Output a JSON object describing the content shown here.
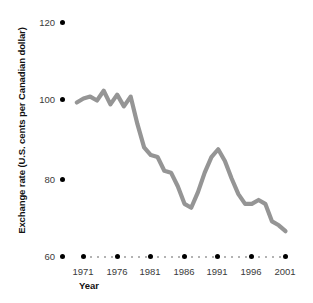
{
  "chart_data": {
    "type": "line",
    "title": "",
    "xlabel": "Year",
    "ylabel": "Exchange rate (U.S. cents per Canadian dollar)",
    "xlim": [
      1970,
      2002
    ],
    "ylim": [
      60,
      120
    ],
    "xticks": [
      1971,
      1976,
      1981,
      1986,
      1991,
      1996,
      2001
    ],
    "xtick_labels": [
      "1971",
      "1976",
      "1981",
      "1986",
      "1991",
      "1996",
      "2001"
    ],
    "yticks": [
      60,
      80,
      100,
      120
    ],
    "ytick_labels": [
      "60",
      "80",
      "100",
      "120"
    ],
    "grid": false,
    "legend": "none",
    "series": [
      {
        "name": "Exchange rate",
        "color": "#959595",
        "x": [
          1970,
          1971,
          1972,
          1973,
          1974,
          1975,
          1976,
          1977,
          1978,
          1979,
          1980,
          1981,
          1982,
          1983,
          1984,
          1985,
          1986,
          1987,
          1988,
          1989,
          1990,
          1991,
          1992,
          1993,
          1994,
          1995,
          1996,
          1997,
          1998,
          1999,
          2000,
          2001
        ],
        "values": [
          99.5,
          100.5,
          101.0,
          100.0,
          102.5,
          99.0,
          101.5,
          98.5,
          101.0,
          94.0,
          88.0,
          86.0,
          85.5,
          82.0,
          81.5,
          78.0,
          73.5,
          72.5,
          76.5,
          81.5,
          85.5,
          87.5,
          84.5,
          80.0,
          76.0,
          73.5,
          73.5,
          74.5,
          73.5,
          69.0,
          68.0,
          66.5
        ]
      }
    ]
  },
  "axes": {
    "y_tick_values": [
      "120",
      "100",
      "80",
      "60"
    ],
    "x_tick_values": [
      "1971",
      "1976",
      "1981",
      "1986",
      "1991",
      "1996",
      "2001"
    ],
    "y_axis_title": "Exchange rate (U.S. cents per Canadian dollar)",
    "x_axis_title": "Year"
  },
  "style": {
    "line_color": "#959595",
    "tick_dot_color": "#000000",
    "minor_dot_color": "#9a9a9a",
    "text_color": "#3a3a3a",
    "background": "#ffffff"
  }
}
